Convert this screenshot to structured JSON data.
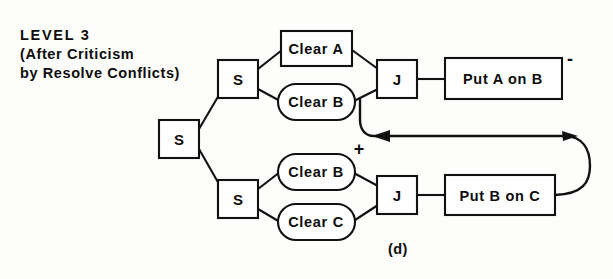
{
  "figure": {
    "caption": "(d)",
    "title_lines": [
      "LEVEL 3",
      "(After Criticism",
      "by Resolve Conflicts)"
    ]
  },
  "nodes": {
    "root_split": {
      "label": "S",
      "shape": "rectangle"
    },
    "upper_split": {
      "label": "S",
      "shape": "rectangle"
    },
    "lower_split": {
      "label": "S",
      "shape": "rectangle"
    },
    "upper_clear_a": {
      "label": "Clear A",
      "shape": "rectangle"
    },
    "upper_clear_b": {
      "label": "Clear B",
      "shape": "stadium"
    },
    "lower_clear_b": {
      "label": "Clear B",
      "shape": "stadium"
    },
    "lower_clear_c": {
      "label": "Clear C",
      "shape": "stadium"
    },
    "upper_join": {
      "label": "J",
      "shape": "rectangle"
    },
    "lower_join": {
      "label": "J",
      "shape": "rectangle"
    },
    "put_a_on_b": {
      "label": "Put A on B",
      "shape": "rectangle"
    },
    "put_b_on_c": {
      "label": "Put B on C",
      "shape": "rectangle"
    }
  },
  "markers": {
    "minus_sign": "-",
    "plus_sign": "+"
  },
  "colors": {
    "ink": "#111111",
    "paper": "#fdfdfb"
  }
}
